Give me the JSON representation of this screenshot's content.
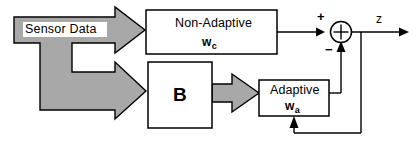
{
  "diagram": {
    "type": "block-diagram",
    "background_color": "#ffffff",
    "line_color": "#000000",
    "arrow_fill_color": "#a8a8a8",
    "arrow_stroke_color": "#000000",
    "input": {
      "label": "Sensor  Data",
      "style": "wide-gray-block-arrow",
      "splits_to": [
        "non-adaptive-block",
        "b-block"
      ]
    },
    "blocks": [
      {
        "id": "non-adaptive-block",
        "title": "Non-Adaptive",
        "subscript_base": "w",
        "subscript": "c",
        "shape": "rectangle"
      },
      {
        "id": "b-block",
        "title": "B",
        "shape": "square"
      },
      {
        "id": "adaptive-block",
        "title": "Adaptive",
        "subscript_base": "w",
        "subscript": "a",
        "shape": "rectangle"
      }
    ],
    "summing_junction": {
      "id": "summing-junction",
      "symbol": "circle-with-cross",
      "inputs": [
        {
          "from": "non-adaptive-block",
          "sign": "+",
          "sign_label": "+"
        },
        {
          "from": "adaptive-block",
          "sign": "-",
          "sign_label": "−"
        }
      ],
      "output": "z"
    },
    "output": {
      "label": "z",
      "feedback_to": "adaptive-block",
      "feedback_description": "output z fed back to Adaptive block"
    }
  }
}
